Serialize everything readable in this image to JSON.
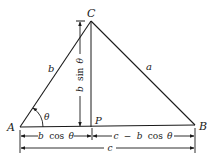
{
  "diagram": {
    "type": "geometry-triangle",
    "vertices": {
      "A": {
        "label": "A",
        "x": 20,
        "y": 127
      },
      "B": {
        "label": "B",
        "x": 195,
        "y": 125
      },
      "C": {
        "label": "C",
        "x": 91,
        "y": 21
      },
      "P": {
        "label": "P",
        "x": 91,
        "y": 127
      }
    },
    "sides": {
      "b": "b",
      "a": "a"
    },
    "angle": "θ",
    "dimensions": {
      "height": {
        "parts": [
          "b",
          "sin",
          "θ"
        ]
      },
      "left_base": {
        "parts": [
          "b",
          "cos",
          "θ"
        ]
      },
      "right_base": {
        "parts": [
          "c",
          "−",
          "b",
          "cos",
          "θ"
        ]
      },
      "full_base": "c"
    },
    "colors": {
      "line": "#1a1a1a",
      "background": "#ffffff"
    }
  }
}
